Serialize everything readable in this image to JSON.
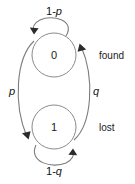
{
  "diagram": {
    "type": "markov-state-transition-diagram",
    "background_color": "#ffffff",
    "node_stroke_color": "#8a8a8a",
    "edge_stroke_color": "#7d7d7d",
    "arrow_color": "#2b2b2b",
    "text_color": "#1a1a1a",
    "states": [
      {
        "id": "state-0",
        "label": "0",
        "annotation": "found",
        "cx": 54,
        "cy": 55,
        "r": 22
      },
      {
        "id": "state-1",
        "label": "1",
        "annotation": "lost",
        "cx": 54,
        "cy": 127,
        "r": 22
      }
    ],
    "transitions": [
      {
        "id": "self-loop-0",
        "from": "state-0",
        "to": "state-0",
        "label_prefix": "1-",
        "label_symbol": "p",
        "label_full": "1-p",
        "label_x": 54,
        "label_y": 12
      },
      {
        "id": "edge-0-to-1",
        "from": "state-0",
        "to": "state-1",
        "label_prefix": "",
        "label_symbol": "p",
        "label_full": "p",
        "label_x": 12,
        "label_y": 92
      },
      {
        "id": "edge-1-to-0",
        "from": "state-1",
        "to": "state-0",
        "label_prefix": "",
        "label_symbol": "q",
        "label_full": "q",
        "label_x": 96,
        "label_y": 92
      },
      {
        "id": "self-loop-1",
        "from": "state-1",
        "to": "state-1",
        "label_prefix": "1-",
        "label_symbol": "q",
        "label_full": "1-q",
        "label_x": 54,
        "label_y": 172
      }
    ],
    "annotations": [
      {
        "id": "annotation-found",
        "text": "found",
        "x": 99,
        "y": 55
      },
      {
        "id": "annotation-lost",
        "text": "lost",
        "x": 99,
        "y": 127
      }
    ]
  }
}
